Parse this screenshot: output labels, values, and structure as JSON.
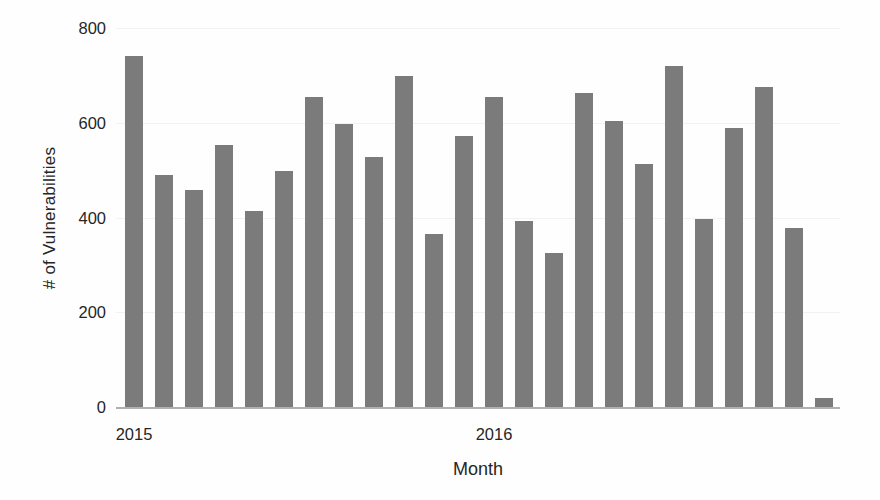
{
  "chart_data": {
    "type": "bar",
    "title": "",
    "subtitle": "",
    "xlabel": "Month",
    "ylabel": "# of Vulnerabilities",
    "ylim": [
      0,
      800
    ],
    "ytick_values": [
      0,
      200,
      400,
      600,
      800
    ],
    "ytick_labels": [
      "0",
      "200",
      "400",
      "600",
      "800"
    ],
    "grid": true,
    "grid_axis": "y",
    "legend": false,
    "legend_position": "none",
    "bar_color": "#7b7b7b",
    "axis_color": "#b0b0b0",
    "gridline_color": "#f2f2f2",
    "text_color": "#262626",
    "background_color": "#fefefe",
    "xtick_labels": [
      "2015",
      "2016"
    ],
    "xtick_positions": [
      0,
      12
    ],
    "categories": [
      "2015-01",
      "2015-02",
      "2015-03",
      "2015-04",
      "2015-05",
      "2015-06",
      "2015-07",
      "2015-08",
      "2015-09",
      "2015-10",
      "2015-11",
      "2015-12",
      "2016-01",
      "2016-02",
      "2016-03",
      "2016-04",
      "2016-05",
      "2016-06",
      "2016-07",
      "2016-08",
      "2016-09",
      "2016-10",
      "2016-11",
      "2016-12"
    ],
    "values": [
      740,
      490,
      458,
      553,
      413,
      498,
      655,
      597,
      527,
      699,
      365,
      573,
      654,
      392,
      326,
      662,
      604,
      512,
      719,
      396,
      590,
      676,
      378,
      19
    ]
  },
  "axes": {
    "y_title": "# of Vulnerabilities",
    "x_title": "Month",
    "y_ticks": [
      "800",
      "600",
      "400",
      "200",
      "0"
    ],
    "x_ticks": [
      "2015",
      "2016"
    ]
  }
}
